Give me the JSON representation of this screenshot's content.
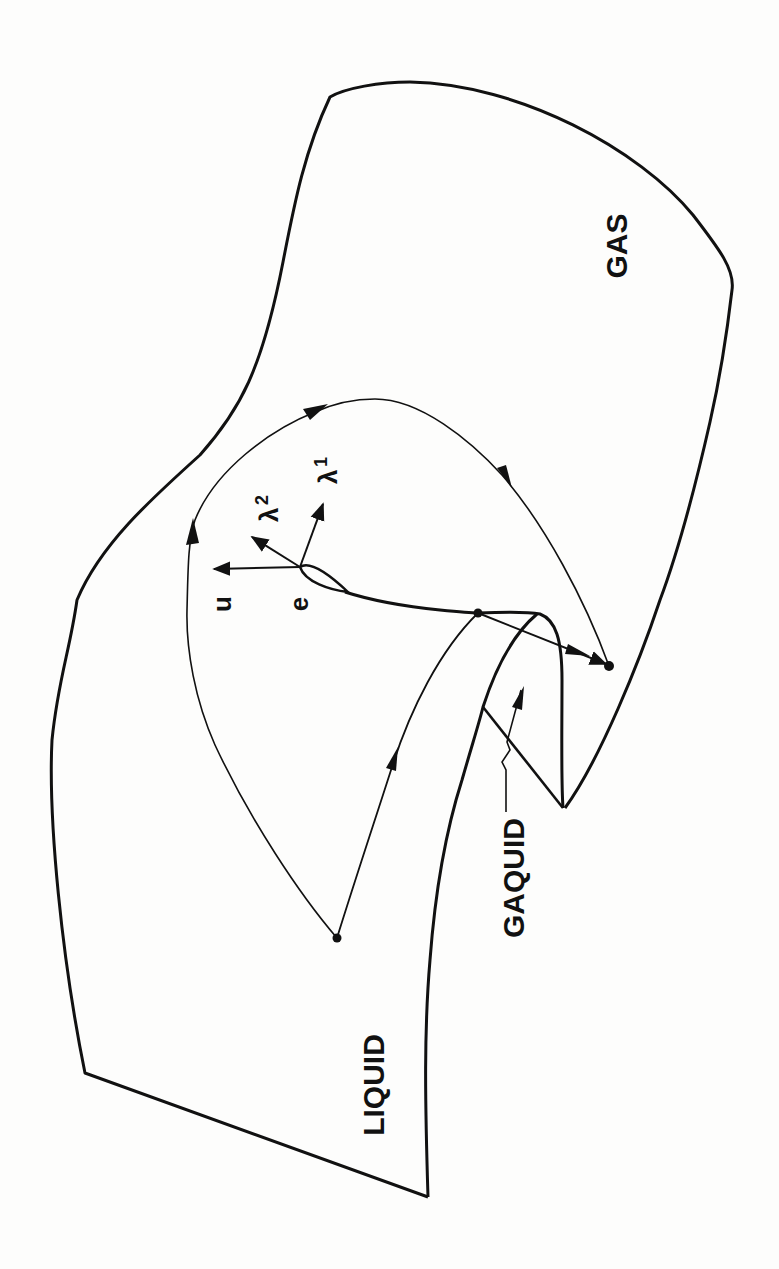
{
  "figure": {
    "type": "phase-surface-diagram",
    "text_orientation": "rotated -90deg (reads bottom-to-top)",
    "regions": {
      "gas": "GAS",
      "liquid": "LIQUID",
      "gaquid": "GAQUID"
    },
    "vectors": {
      "u": "u",
      "e": "e",
      "lambda1": "λ",
      "lambda1_sub": "1",
      "lambda2": "λ",
      "lambda2_sub": "2"
    },
    "colors": {
      "ink": "#111111",
      "paper": "#fdfdfc"
    }
  }
}
